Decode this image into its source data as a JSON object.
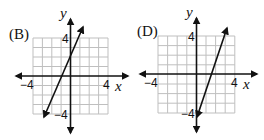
{
  "figure": {
    "graphs": [
      {
        "id": "B",
        "label": "(B)",
        "x_axis_label": "x",
        "y_axis_label": "y",
        "ticks": {
          "x_min": "−4",
          "x_max": "4",
          "y_max": "4",
          "y_min": "−4"
        },
        "grid": {
          "x_range": [
            -4,
            4
          ],
          "y_range": [
            -4,
            4
          ],
          "step": 1
        },
        "line": {
          "from": [
            -2.8,
            -4.5
          ],
          "to": [
            1.35,
            5.3
          ],
          "x_intercept": -0.6,
          "y_intercept": 1.4,
          "both_ends_arrows": true
        }
      },
      {
        "id": "D",
        "label": "(D)",
        "x_axis_label": "x",
        "y_axis_label": "y",
        "ticks": {
          "x_min": "−4",
          "x_max": "4",
          "y_max": "4",
          "y_min": "−4"
        },
        "grid": {
          "x_range": [
            -4,
            4
          ],
          "y_range": [
            -4,
            4
          ],
          "step": 1
        },
        "line": {
          "from": [
            0,
            -4.5
          ],
          "to": [
            3.2,
            4.9
          ],
          "x_intercept": 1.5,
          "y_intercept": -4.4,
          "both_ends_arrows": true
        }
      }
    ],
    "colors": {
      "grid": "#bfbfbf",
      "axis": "#111111",
      "line": "#111111"
    }
  }
}
